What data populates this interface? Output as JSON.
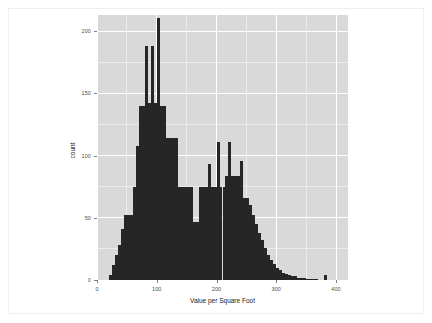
{
  "figure": {
    "background_color": "#ffffff",
    "panel_color": "#d9d9d9",
    "bar_color": "#262626",
    "gridline_color": "#ffffff",
    "axis_text_color": "#4d4d4d"
  },
  "axes": {
    "x_title": "Value per Square Foot",
    "y_title": "count",
    "x_ticks": [
      "0",
      "100",
      "200",
      "300",
      "400"
    ],
    "y_ticks": [
      "0",
      "50",
      "100",
      "150",
      "200"
    ]
  },
  "chart_data": {
    "type": "bar",
    "subtype": "histogram",
    "title": "",
    "xlabel": "Value per Square Foot",
    "ylabel": "count",
    "xlim": [
      0,
      420
    ],
    "ylim": [
      0,
      213
    ],
    "xticks": [
      0,
      100,
      200,
      300,
      400
    ],
    "yticks": [
      0,
      50,
      100,
      150,
      200
    ],
    "grid": true,
    "legend": null,
    "bin_width": 5,
    "bin_starts": [
      20,
      25,
      30,
      35,
      40,
      45,
      50,
      55,
      60,
      65,
      70,
      75,
      80,
      85,
      90,
      95,
      100,
      105,
      110,
      115,
      120,
      125,
      130,
      135,
      140,
      145,
      150,
      155,
      160,
      165,
      170,
      175,
      180,
      185,
      190,
      195,
      200,
      205,
      210,
      215,
      220,
      225,
      230,
      235,
      240,
      245,
      250,
      255,
      260,
      265,
      270,
      275,
      280,
      285,
      290,
      295,
      300,
      305,
      310,
      315,
      320,
      325,
      330,
      335,
      340,
      345,
      350,
      355,
      360,
      365,
      370,
      375,
      380,
      385
    ],
    "values": [
      4,
      12,
      20,
      28,
      41,
      52,
      52,
      52,
      75,
      108,
      140,
      140,
      188,
      142,
      188,
      142,
      211,
      140,
      140,
      114,
      114,
      114,
      114,
      75,
      75,
      75,
      75,
      75,
      47,
      47,
      75,
      75,
      75,
      93,
      75,
      75,
      111,
      75,
      75,
      84,
      111,
      84,
      84,
      84,
      96,
      66,
      66,
      60,
      52,
      45,
      38,
      32,
      26,
      20,
      16,
      13,
      10,
      8,
      6,
      5,
      4,
      3,
      3,
      2,
      2,
      2,
      1,
      1,
      1,
      1,
      0,
      0,
      4,
      0
    ],
    "categories": [
      "20",
      "25",
      "30",
      "35",
      "40",
      "45",
      "50",
      "55",
      "60",
      "65",
      "70",
      "75",
      "80",
      "85",
      "90",
      "95",
      "100",
      "105",
      "110",
      "115",
      "120",
      "125",
      "130",
      "135",
      "140",
      "145",
      "150",
      "155",
      "160",
      "165",
      "170",
      "175",
      "180",
      "185",
      "190",
      "195",
      "200",
      "205",
      "210",
      "215",
      "220",
      "225",
      "230",
      "235",
      "240",
      "245",
      "250",
      "255",
      "260",
      "265",
      "270",
      "275",
      "280",
      "285",
      "290",
      "295",
      "300",
      "305",
      "310",
      "315",
      "320",
      "325",
      "330",
      "335",
      "340",
      "345",
      "350",
      "355",
      "360",
      "365",
      "370",
      "375",
      "380",
      "385"
    ]
  }
}
